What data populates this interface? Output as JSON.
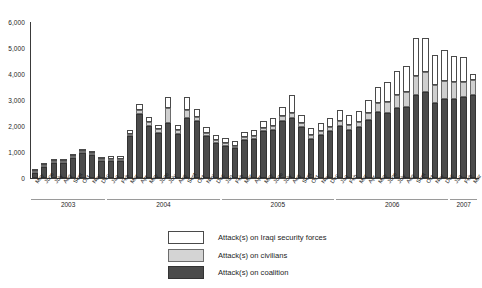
{
  "chart_data": {
    "type": "bar",
    "stacked": true,
    "title": "",
    "xlabel": "",
    "ylabel": "",
    "ylim": [
      0,
      6000
    ],
    "yticks": [
      "0",
      "1,000",
      "2,000",
      "3,000",
      "4,000",
      "5,000",
      "6,000"
    ],
    "ytick_values": [
      0,
      1000,
      2000,
      3000,
      4000,
      5000,
      6000
    ],
    "grid": false,
    "legend_position": "bottom-center",
    "categories": [
      "May",
      "June",
      "July",
      "Aug",
      "Sept",
      "Oct",
      "Nov",
      "Dec",
      "Jan",
      "Feb",
      "Mar",
      "Apr",
      "May",
      "June",
      "July",
      "Aug",
      "Sept",
      "Oct",
      "Nov",
      "Dec",
      "Jan",
      "Feb",
      "Mar",
      "Apr",
      "May",
      "June",
      "July",
      "Aug",
      "Sept",
      "Oct",
      "Nov",
      "Dec",
      "Jan",
      "Feb",
      "Mar",
      "Apr",
      "May",
      "June",
      "July",
      "Aug",
      "Sept",
      "Oct",
      "Nov",
      "Dec",
      "Jan",
      "Feb",
      "Mar"
    ],
    "year_groups": [
      {
        "label": "2003",
        "count": 8
      },
      {
        "label": "2004",
        "count": 12
      },
      {
        "label": "2005",
        "count": 12
      },
      {
        "label": "2006",
        "count": 12
      },
      {
        "label": "2007",
        "count": 3
      }
    ],
    "series": [
      {
        "name": "Attack(s) on coalition",
        "key": "coalition",
        "color": "#4b4b4b",
        "values": [
          180,
          430,
          560,
          580,
          760,
          980,
          900,
          660,
          650,
          650,
          1600,
          2450,
          2000,
          1750,
          2100,
          1700,
          2300,
          2200,
          1600,
          1350,
          1250,
          1150,
          1450,
          1500,
          1800,
          1850,
          2200,
          2300,
          1950,
          1500,
          1650,
          1800,
          2000,
          1850,
          1950,
          2250,
          2550,
          2500,
          2700,
          2750,
          3200,
          3300,
          2900,
          3050,
          3050,
          3100,
          3200
        ]
      },
      {
        "name": "Attack(s) on civilians",
        "key": "civilians",
        "color": "#cfcfcf",
        "values": [
          15,
          20,
          25,
          30,
          40,
          60,
          80,
          60,
          60,
          60,
          90,
          160,
          140,
          120,
          600,
          130,
          330,
          150,
          120,
          100,
          100,
          100,
          110,
          120,
          140,
          150,
          180,
          200,
          170,
          140,
          150,
          170,
          200,
          190,
          220,
          260,
          340,
          420,
          500,
          560,
          720,
          780,
          680,
          700,
          640,
          600,
          560
        ]
      },
      {
        "name": "Attack(s) on Iraqi security forces",
        "key": "isf",
        "color": "#ffffff",
        "values": [
          10,
          15,
          20,
          25,
          35,
          50,
          70,
          90,
          110,
          110,
          160,
          230,
          200,
          180,
          420,
          220,
          480,
          320,
          230,
          200,
          200,
          190,
          210,
          230,
          260,
          300,
          340,
          700,
          320,
          280,
          300,
          330,
          400,
          380,
          420,
          500,
          620,
          780,
          900,
          1000,
          1450,
          1300,
          1150,
          1180,
          1010,
          940,
          240
        ]
      }
    ],
    "legend": [
      {
        "label": "Attack(s) on Iraqi security forces",
        "swatch": "isf"
      },
      {
        "label": "Attack(s) on civilians",
        "swatch": "civilians"
      },
      {
        "label": "Attack(s) on coalition",
        "swatch": "coalition"
      }
    ]
  }
}
